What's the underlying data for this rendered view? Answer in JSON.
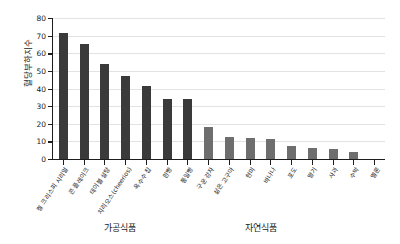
{
  "chart_data": {
    "type": "bar",
    "title": "",
    "xlabel": "",
    "ylabel": "혈당부하지수",
    "ylim": [
      0,
      80
    ],
    "yticks": [
      0,
      10,
      20,
      30,
      40,
      50,
      60,
      70,
      80
    ],
    "grid": true,
    "legend": null,
    "categories": [
      "켈 크리스피 시리얼",
      "콘 플레이크",
      "테이블 설탕",
      "치리오스(cheerios)",
      "옥수수 칩",
      "흰빵",
      "통밀빵",
      "구운 감자",
      "삶은 고구마",
      "현미",
      "바나나",
      "포도",
      "딸기",
      "사과",
      "수박",
      "멜론"
    ],
    "values": [
      71.5,
      65,
      54,
      47,
      41.5,
      34,
      34,
      18,
      12.5,
      12,
      11.5,
      7.5,
      6.5,
      5.5,
      4,
      0
    ],
    "bar_colors": [
      "#3a3a3a",
      "#3a3a3a",
      "#3a3a3a",
      "#3a3a3a",
      "#3a3a3a",
      "#3a3a3a",
      "#3a3a3a",
      "#6e6e6e",
      "#6e6e6e",
      "#6e6e6e",
      "#6e6e6e",
      "#6e6e6e",
      "#6e6e6e",
      "#6e6e6e",
      "#6e6e6e",
      "#6e6e6e"
    ],
    "annotations": [
      {
        "text": "가공식품"
      },
      {
        "text": "자연식품"
      }
    ]
  },
  "groups": {
    "processed": "가공식품",
    "natural": "자연식품"
  },
  "colors": {
    "processed_bar": "#3a3a3a",
    "natural_bar": "#6e6e6e",
    "axis": "#1d1d1d",
    "grid": "#e3e3e3",
    "text": "#1a1a1a",
    "background": "#ffffff"
  }
}
